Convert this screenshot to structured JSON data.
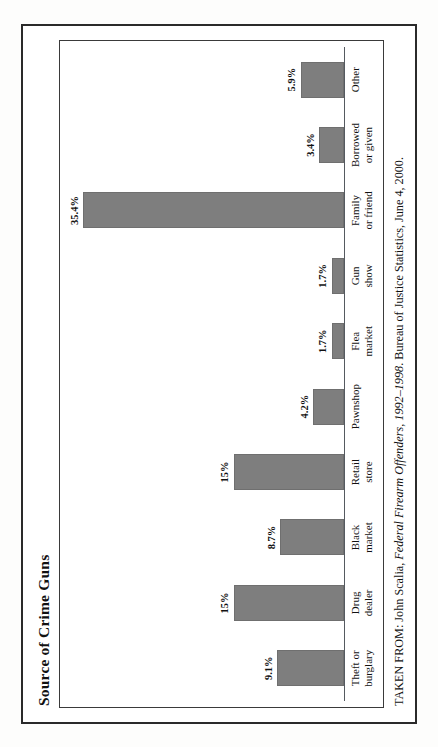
{
  "figure": {
    "title": "Source of Crime Guns",
    "source_prefix": "TAKEN FROM: John Scalia, ",
    "source_italic": "Federal Firearm Offenders, 1992–1998",
    "source_suffix": ". Bureau of Justice Statistics, June 4, 2000.",
    "source_full": "TAKEN FROM: John Scalia, Federal Firearm Offenders, 1992–1998. Bureau of Justice Statistics, June 4, 2000.",
    "bar_color": "#7e7e7e",
    "frame_color": "#2a2a2a",
    "axis_color": "#555a60",
    "paper_color": "#fdfdfc"
  },
  "chart_data": {
    "type": "bar",
    "title": "Source of Crime Guns",
    "xlabel": "",
    "ylabel": "",
    "ylim": [
      0,
      38
    ],
    "grid": false,
    "legend": "none",
    "orientation": "vertical",
    "categories": [
      "Theft or burglary",
      "Drug dealer",
      "Black market",
      "Retail store",
      "Pawnshop",
      "Flea market",
      "Gun show",
      "Family or friend",
      "Borrowed or given",
      "Other"
    ],
    "category_lines": [
      "Theft or\nburglary",
      "Drug\ndealer",
      "Black\nmarket",
      "Retail\nstore",
      "Pawnshop",
      "Flea\nmarket",
      "Gun\nshow",
      "Family\nor friend",
      "Borrowed\nor given",
      "Other"
    ],
    "values": [
      9.1,
      15,
      8.7,
      15,
      4.2,
      1.7,
      1.7,
      35.4,
      3.4,
      5.9
    ],
    "value_labels": [
      "9.1%",
      "15%",
      "8.7%",
      "15%",
      "4.2%",
      "1.7%",
      "1.7%",
      "35.4%",
      "3.4%",
      "5.9%"
    ]
  }
}
